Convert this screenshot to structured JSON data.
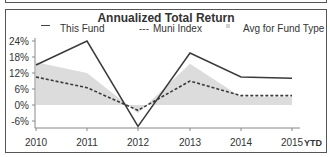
{
  "chart_data": {
    "type": "line",
    "title": "Annualized Total Return",
    "xlabel": "",
    "ylabel": "",
    "categories": [
      "2010",
      "2011",
      "2012",
      "2013",
      "2014",
      "2015"
    ],
    "x_suffix_label": "YTD",
    "yticks": [
      "24%",
      "18%",
      "12%",
      "6%",
      "0%",
      "-6%"
    ],
    "ylim": [
      -8,
      25
    ],
    "grid": false,
    "legend_position": "top",
    "series": [
      {
        "name": "This Fund",
        "style": "solid",
        "values": [
          15,
          24,
          -8,
          19.5,
          10.5,
          10
        ]
      },
      {
        "name": "Muni Index",
        "style": "dashed",
        "values": [
          10.5,
          6.5,
          -2,
          9,
          3.5,
          3.5
        ]
      },
      {
        "name": "Avg for Fund Type",
        "style": "area",
        "values": [
          16,
          12,
          -3,
          15.5,
          3,
          3
        ]
      }
    ]
  },
  "legend": {
    "fund": "This Fund",
    "index_prefix": "---",
    "index": "Muni Index",
    "avg": "Avg for Fund Type"
  },
  "colors": {
    "fund_line": "#3a3a3a",
    "index_line": "#3a3a3a",
    "avg_fill": "#dcdcdc",
    "axis": "#888888"
  }
}
